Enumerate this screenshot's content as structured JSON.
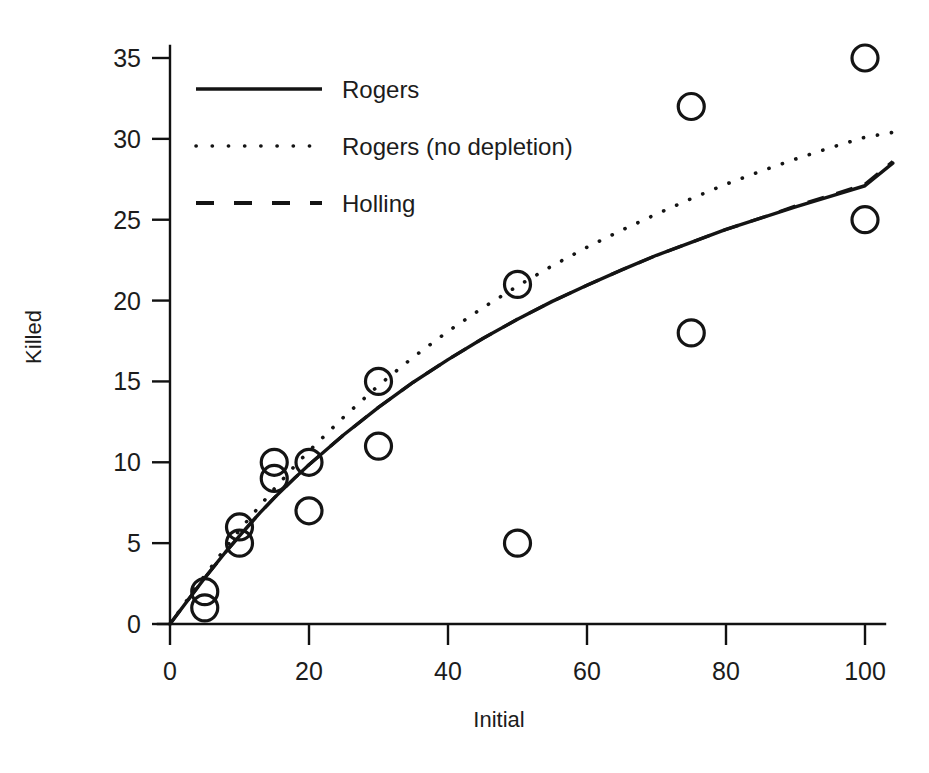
{
  "chart_data": {
    "type": "scatter",
    "title": "",
    "xlabel": "Initial",
    "ylabel": "Killed",
    "xlim": [
      -4,
      107
    ],
    "ylim": [
      -1.2,
      36.5
    ],
    "xticks": [
      0,
      20,
      40,
      60,
      80,
      100
    ],
    "yticks": [
      0,
      5,
      10,
      15,
      20,
      25,
      30,
      35
    ],
    "xtick_labels": [
      "0",
      "20",
      "40",
      "60",
      "80",
      "100"
    ],
    "ytick_labels": [
      "0",
      "5",
      "10",
      "15",
      "20",
      "25",
      "30",
      "35"
    ],
    "grid": false,
    "legend_position": "upper left",
    "points": [
      {
        "x": 5,
        "y": 2
      },
      {
        "x": 5,
        "y": 1
      },
      {
        "x": 10,
        "y": 6
      },
      {
        "x": 10,
        "y": 5
      },
      {
        "x": 15,
        "y": 10
      },
      {
        "x": 15,
        "y": 9
      },
      {
        "x": 20,
        "y": 10
      },
      {
        "x": 20,
        "y": 7
      },
      {
        "x": 30,
        "y": 15
      },
      {
        "x": 30,
        "y": 11
      },
      {
        "x": 50,
        "y": 21
      },
      {
        "x": 50,
        "y": 5
      },
      {
        "x": 75,
        "y": 32
      },
      {
        "x": 75,
        "y": 18
      },
      {
        "x": 100,
        "y": 35
      },
      {
        "x": 100,
        "y": 25
      }
    ],
    "series": [
      {
        "name": "Rogers",
        "style": "solid",
        "x": [
          0,
          2,
          5,
          8,
          10,
          13,
          15,
          18,
          20,
          25,
          30,
          35,
          40,
          45,
          50,
          55,
          60,
          65,
          70,
          75,
          80,
          85,
          90,
          95,
          100,
          104
        ],
        "values": [
          0.0,
          1.15,
          2.85,
          4.45,
          5.45,
          6.9,
          7.8,
          9.05,
          9.85,
          11.7,
          13.4,
          14.95,
          16.35,
          17.65,
          18.85,
          19.95,
          20.95,
          21.9,
          22.8,
          23.6,
          24.4,
          25.1,
          25.8,
          26.45,
          27.1,
          28.5
        ]
      },
      {
        "name": "Rogers (no depletion)",
        "style": "dotted",
        "x": [
          0,
          2,
          5,
          8,
          10,
          13,
          15,
          18,
          20,
          25,
          30,
          35,
          40,
          45,
          50,
          55,
          60,
          65,
          70,
          75,
          80,
          85,
          90,
          95,
          100,
          104
        ],
        "values": [
          0.0,
          1.2,
          3.0,
          4.7,
          5.8,
          7.35,
          8.35,
          9.8,
          10.7,
          12.8,
          14.75,
          16.5,
          18.1,
          19.55,
          20.9,
          22.15,
          23.3,
          24.35,
          25.35,
          26.3,
          27.2,
          28.0,
          28.75,
          29.45,
          30.1,
          30.4
        ]
      },
      {
        "name": "Holling",
        "style": "dashed",
        "x": [
          0,
          2,
          5,
          8,
          10,
          13,
          15,
          18,
          20,
          25,
          30,
          35,
          40,
          45,
          50,
          55,
          60,
          65,
          70,
          75,
          80,
          85,
          90,
          95,
          100,
          104
        ],
        "values": [
          0.0,
          1.15,
          2.85,
          4.45,
          5.45,
          6.9,
          7.8,
          9.05,
          9.85,
          11.7,
          13.4,
          14.95,
          16.35,
          17.65,
          18.85,
          19.95,
          20.95,
          21.9,
          22.8,
          23.6,
          24.4,
          25.1,
          25.85,
          26.5,
          27.2,
          28.6
        ]
      }
    ],
    "legend": [
      {
        "label": "Rogers",
        "style": "solid"
      },
      {
        "label": "Rogers (no depletion)",
        "style": "dotted"
      },
      {
        "label": "Holling",
        "style": "dashed"
      }
    ],
    "marker": "open-circle",
    "colors": {
      "ink": "#141414",
      "background": "#ffffff"
    }
  }
}
